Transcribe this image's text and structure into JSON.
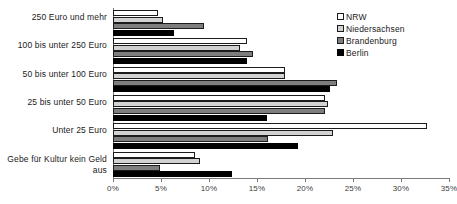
{
  "chart_data": {
    "type": "bar",
    "orientation": "horizontal",
    "title": "",
    "xlabel": "",
    "ylabel": "",
    "xlim": [
      0,
      35
    ],
    "xtick_labels": [
      "0%",
      "5%",
      "10%",
      "15%",
      "20%",
      "25%",
      "30%",
      "35%"
    ],
    "xticks": [
      0,
      5,
      10,
      15,
      20,
      25,
      30,
      35
    ],
    "grid": false,
    "legend_position": "top-right",
    "categories": [
      "250 Euro und mehr",
      "100 bis unter 250 Euro",
      "50 bis unter 100 Euro",
      "25 bis unter 50 Euro",
      "Unter 25 Euro",
      "Gebe für Kultur kein Geld aus"
    ],
    "series": [
      {
        "name": "NRW",
        "color": "#ffffff",
        "values": [
          4.7,
          14.0,
          17.9,
          22.1,
          32.7,
          8.5
        ]
      },
      {
        "name": "Niedersachsen",
        "color": "#d2d2d2",
        "values": [
          5.2,
          13.2,
          17.9,
          22.4,
          22.9,
          9.1
        ]
      },
      {
        "name": "Brandenburg",
        "color": "#7e7e7e",
        "values": [
          9.5,
          14.6,
          23.3,
          22.1,
          16.1,
          4.9
        ]
      },
      {
        "name": "Berlin",
        "color": "#000000",
        "values": [
          6.4,
          14.0,
          22.6,
          16.0,
          19.3,
          12.4
        ]
      }
    ]
  },
  "legend": {
    "items": [
      {
        "label": "NRW"
      },
      {
        "label": "Niedersachsen"
      },
      {
        "label": "Brandenburg"
      },
      {
        "label": "Berlin"
      }
    ]
  }
}
